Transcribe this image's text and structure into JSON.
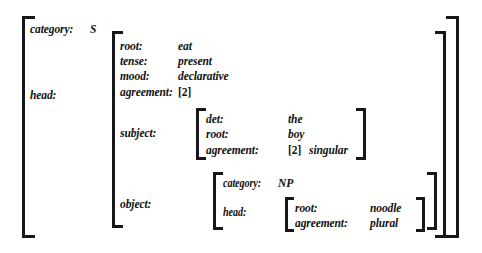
{
  "diagram": {
    "kind": "attribute-value-matrix",
    "colors": {
      "background": "#ffffff",
      "ink": "#17171a"
    },
    "root": {
      "rows": [
        {
          "attr": "category:",
          "value": "S"
        },
        {
          "attr": "head:",
          "value": ""
        }
      ]
    },
    "head": {
      "rows": [
        {
          "attr": "root:",
          "value": "eat"
        },
        {
          "attr": "tense:",
          "value": "present"
        },
        {
          "attr": "mood:",
          "value": "declarative"
        },
        {
          "attr": "agreement:",
          "value": "[2]"
        },
        {
          "attr": "subject:",
          "value": ""
        },
        {
          "attr": "object:",
          "value": ""
        }
      ]
    },
    "subject": {
      "rows": [
        {
          "attr": "det:",
          "value": "the"
        },
        {
          "attr": "root:",
          "value": "boy"
        },
        {
          "attr": "agreement:",
          "tag": "[2]",
          "value": "singular"
        }
      ]
    },
    "object": {
      "rows": [
        {
          "attr": "category:",
          "value": "NP"
        },
        {
          "attr": "head:",
          "value": ""
        }
      ]
    },
    "object_head": {
      "rows": [
        {
          "attr": "root:",
          "value": "noodle"
        },
        {
          "attr": "agreement:",
          "value": "plural"
        }
      ]
    }
  }
}
